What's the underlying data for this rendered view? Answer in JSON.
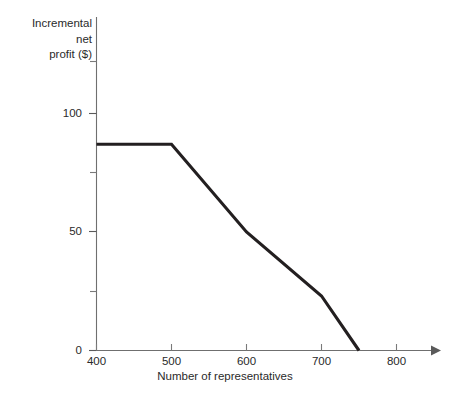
{
  "chart_data": {
    "type": "line",
    "title": "",
    "xlabel": "Number of representatives",
    "ylabel": "Incremental\nnet\nprofit ($)",
    "ylabel_lines": [
      "Incremental",
      "net",
      "profit ($)"
    ],
    "xlim": [
      400,
      820
    ],
    "ylim": [
      0,
      130
    ],
    "xticks": [
      400,
      500,
      600,
      700,
      800
    ],
    "xtick_labels": [
      "400",
      "500",
      "600",
      "700",
      "800"
    ],
    "yticks": [
      0,
      50,
      100
    ],
    "ytick_labels": [
      "0",
      "50",
      "100"
    ],
    "yticks_minor": [
      25,
      75,
      125
    ],
    "grid": false,
    "legend": null,
    "series": [
      {
        "name": "Incremental net profit",
        "color": "#231f20",
        "x": [
          400,
          500,
          600,
          700,
          750
        ],
        "y": [
          87,
          87,
          50,
          23,
          0
        ]
      }
    ],
    "axis_color": "#6f6f6f",
    "x_axis_arrow": true
  },
  "axis": {
    "x_tick_400": "400",
    "x_tick_500": "500",
    "x_tick_600": "600",
    "x_tick_700": "700",
    "x_tick_800": "800",
    "y_tick_0": "0",
    "y_tick_50": "50",
    "y_tick_100": "100",
    "x_title": "Number of representatives",
    "y_title_line1": "Incremental",
    "y_title_line2": "net",
    "y_title_line3": "profit ($)"
  }
}
